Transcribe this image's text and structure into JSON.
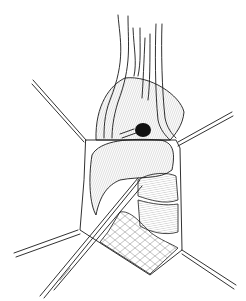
{
  "illustration": {
    "subject": "surgical-field-line-drawing",
    "colors": {
      "background": "#ffffff",
      "ink": "#1a1a1a"
    },
    "elements": [
      "retractor-upper-left",
      "retractor-upper-right",
      "retractor-lower-left",
      "retractor-lower-right",
      "vessels-top",
      "organ-mass",
      "dark-nodule",
      "forceps-instrument",
      "tissue-layers"
    ]
  }
}
